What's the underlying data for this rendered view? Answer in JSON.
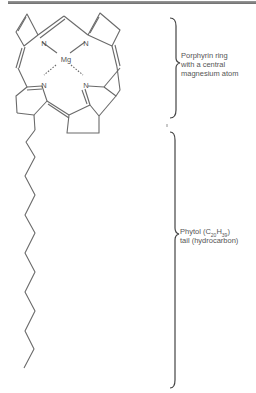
{
  "figure": {
    "atoms": {
      "nitrogen": "N",
      "magnesium": "Mg"
    },
    "labels": {
      "porphyrin": {
        "line1": "Porphyrin ring",
        "line2": "with a central",
        "line3": "magnesium atom"
      },
      "phytol": {
        "line1_pre": "Phytol (C",
        "sub1": "20",
        "mid": "H",
        "sub2": "39",
        "line1_post": ")",
        "line2": "tail (hydrocarbon)"
      }
    },
    "colors": {
      "bond": "#666666",
      "brace": "#444444",
      "text": "#555555"
    }
  }
}
